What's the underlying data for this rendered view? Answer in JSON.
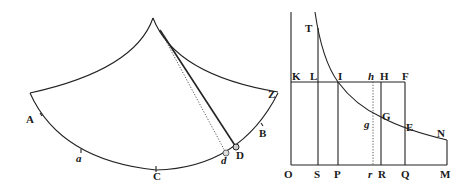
{
  "figures": [
    {
      "id": "cycloidal-pendulum",
      "labels": {
        "apex": "",
        "A": "A",
        "a": "a",
        "C": "C",
        "d": "d",
        "D": "D",
        "B": "B",
        "Z": "Z"
      }
    },
    {
      "id": "hyperbola-area",
      "labels": {
        "T": "T",
        "K": "K",
        "L": "L",
        "I": "I",
        "h": "h",
        "H": "H",
        "F": "F",
        "g": "g",
        "G": "G",
        "E": "E",
        "N": "N",
        "O": "O",
        "S": "S",
        "P": "P",
        "r": "r",
        "R": "R",
        "Q": "Q",
        "M": "M"
      }
    }
  ],
  "colors": {
    "ink": "#222222",
    "paper": "#ffffff"
  }
}
